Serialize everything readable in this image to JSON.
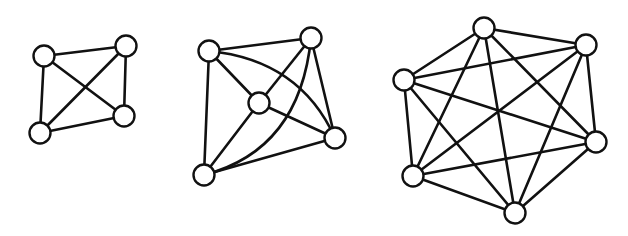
{
  "figure": {
    "colors": {
      "background": "#ffffff",
      "stroke": "#111111",
      "node_fill": "#ffffff"
    },
    "node_radius": 10.5,
    "graphs": [
      {
        "id": "k4",
        "name": "K4",
        "nodes": [
          {
            "id": "a",
            "x": 44,
            "y": 56
          },
          {
            "id": "b",
            "x": 126,
            "y": 46
          },
          {
            "id": "c",
            "x": 124,
            "y": 116
          },
          {
            "id": "d",
            "x": 40,
            "y": 133
          }
        ],
        "edges": [
          {
            "from": "a",
            "to": "b"
          },
          {
            "from": "a",
            "to": "c"
          },
          {
            "from": "a",
            "to": "d"
          },
          {
            "from": "b",
            "to": "c"
          },
          {
            "from": "b",
            "to": "d"
          },
          {
            "from": "c",
            "to": "d"
          }
        ]
      },
      {
        "id": "k5",
        "name": "K5",
        "nodes": [
          {
            "id": "a",
            "x": 209,
            "y": 51
          },
          {
            "id": "b",
            "x": 311,
            "y": 38
          },
          {
            "id": "c",
            "x": 259,
            "y": 103
          },
          {
            "id": "d",
            "x": 335,
            "y": 138
          },
          {
            "id": "e",
            "x": 204,
            "y": 175
          }
        ],
        "edges": [
          {
            "from": "a",
            "to": "b"
          },
          {
            "from": "a",
            "to": "c"
          },
          {
            "from": "a",
            "to": "e"
          },
          {
            "from": "a",
            "to": "d",
            "curve": {
              "cx": 300,
              "cy": 60
            }
          },
          {
            "from": "b",
            "to": "c"
          },
          {
            "from": "b",
            "to": "d"
          },
          {
            "from": "b",
            "to": "e",
            "curve": {
              "cx": 300,
              "cy": 150
            }
          },
          {
            "from": "c",
            "to": "d"
          },
          {
            "from": "c",
            "to": "e"
          },
          {
            "from": "d",
            "to": "e"
          }
        ]
      },
      {
        "id": "k6",
        "name": "K6",
        "nodes": [
          {
            "id": "a",
            "x": 484,
            "y": 28
          },
          {
            "id": "b",
            "x": 586,
            "y": 45
          },
          {
            "id": "c",
            "x": 404,
            "y": 80
          },
          {
            "id": "d",
            "x": 596,
            "y": 142
          },
          {
            "id": "e",
            "x": 413,
            "y": 176
          },
          {
            "id": "f",
            "x": 515,
            "y": 213
          }
        ],
        "edges": [
          {
            "from": "a",
            "to": "b"
          },
          {
            "from": "a",
            "to": "c"
          },
          {
            "from": "a",
            "to": "d"
          },
          {
            "from": "a",
            "to": "e"
          },
          {
            "from": "a",
            "to": "f"
          },
          {
            "from": "b",
            "to": "c"
          },
          {
            "from": "b",
            "to": "d"
          },
          {
            "from": "b",
            "to": "e"
          },
          {
            "from": "b",
            "to": "f"
          },
          {
            "from": "c",
            "to": "d"
          },
          {
            "from": "c",
            "to": "e"
          },
          {
            "from": "c",
            "to": "f"
          },
          {
            "from": "d",
            "to": "e"
          },
          {
            "from": "d",
            "to": "f"
          },
          {
            "from": "e",
            "to": "f"
          }
        ]
      }
    ]
  }
}
